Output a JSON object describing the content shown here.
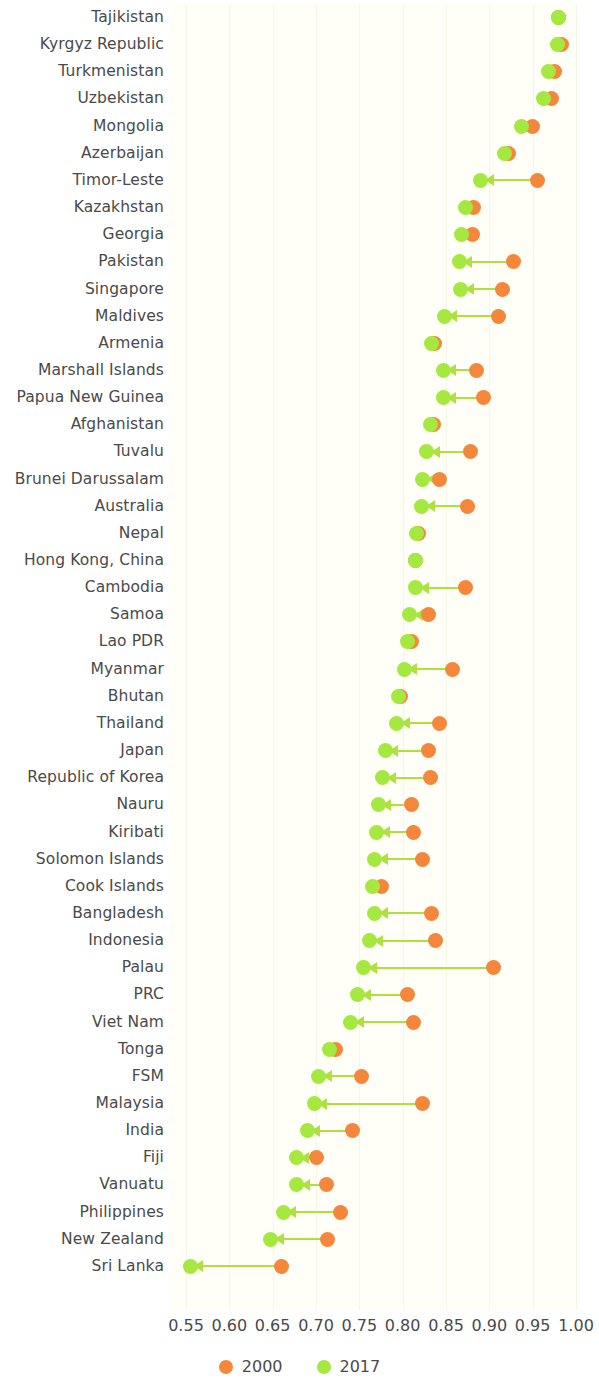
{
  "chart_data": {
    "type": "scatter",
    "title": "",
    "subtitle": "",
    "xlabel": "",
    "ylabel": "",
    "xlim": [
      0.55,
      1.0
    ],
    "xticks": [
      0.55,
      0.6,
      0.65,
      0.7,
      0.75,
      0.8,
      0.85,
      0.9,
      0.95,
      1.0
    ],
    "xtick_labels": [
      "0.55",
      "0.60",
      "0.65",
      "0.70",
      "0.75",
      "0.80",
      "0.85",
      "0.90",
      "0.95",
      "1.00"
    ],
    "grid": true,
    "legend_position": "bottom",
    "orientation": "horizontal",
    "series": [
      {
        "name": "2000",
        "color": "#f5873c"
      },
      {
        "name": "2017",
        "color": "#a5e83f"
      }
    ],
    "categories": [
      "Tajikistan",
      "Kyrgyz Republic",
      "Turkmenistan",
      "Uzbekistan",
      "Mongolia",
      "Azerbaijan",
      "Timor-Leste",
      "Kazakhstan",
      "Georgia",
      "Pakistan",
      "Singapore",
      "Maldives",
      "Armenia",
      "Marshall Islands",
      "Papua New Guinea",
      "Afghanistan",
      "Tuvalu",
      "Brunei Darussalam",
      "Australia",
      "Nepal",
      "Hong Kong, China",
      "Cambodia",
      "Samoa",
      "Lao PDR",
      "Myanmar",
      "Bhutan",
      "Thailand",
      "Japan",
      "Republic of Korea",
      "Nauru",
      "Kiribati",
      "Solomon Islands",
      "Cook Islands",
      "Bangladesh",
      "Indonesia",
      "Palau",
      "PRC",
      "Viet Nam",
      "Tonga",
      "FSM",
      "Malaysia",
      "India",
      "Fiji",
      "Vanuatu",
      "Philippines",
      "New Zealand",
      "Sri Lanka"
    ],
    "points": [
      {
        "category": "Tajikistan",
        "v2000": 0.98,
        "v2017": 0.98
      },
      {
        "category": "Kyrgyz Republic",
        "v2000": 0.983,
        "v2017": 0.979
      },
      {
        "category": "Turkmenistan",
        "v2000": 0.975,
        "v2017": 0.968
      },
      {
        "category": "Uzbekistan",
        "v2000": 0.972,
        "v2017": 0.963
      },
      {
        "category": "Mongolia",
        "v2000": 0.95,
        "v2017": 0.937
      },
      {
        "category": "Azerbaijan",
        "v2000": 0.922,
        "v2017": 0.918
      },
      {
        "category": "Timor-Leste",
        "v2000": 0.955,
        "v2017": 0.89
      },
      {
        "category": "Kazakhstan",
        "v2000": 0.882,
        "v2017": 0.872
      },
      {
        "category": "Georgia",
        "v2000": 0.88,
        "v2017": 0.868
      },
      {
        "category": "Pakistan",
        "v2000": 0.928,
        "v2017": 0.865
      },
      {
        "category": "Singapore",
        "v2000": 0.915,
        "v2017": 0.867
      },
      {
        "category": "Maldives",
        "v2000": 0.91,
        "v2017": 0.848
      },
      {
        "category": "Armenia",
        "v2000": 0.837,
        "v2017": 0.833
      },
      {
        "category": "Marshall Islands",
        "v2000": 0.885,
        "v2017": 0.847
      },
      {
        "category": "Papua New Guinea",
        "v2000": 0.893,
        "v2017": 0.847
      },
      {
        "category": "Afghanistan",
        "v2000": 0.836,
        "v2017": 0.832
      },
      {
        "category": "Tuvalu",
        "v2000": 0.878,
        "v2017": 0.828
      },
      {
        "category": "Brunei Darussalam",
        "v2000": 0.842,
        "v2017": 0.823
      },
      {
        "category": "Australia",
        "v2000": 0.875,
        "v2017": 0.822
      },
      {
        "category": "Nepal",
        "v2000": 0.818,
        "v2017": 0.816
      },
      {
        "category": "Hong Kong, China",
        "v2000": 0.815,
        "v2017": 0.815
      },
      {
        "category": "Cambodia",
        "v2000": 0.872,
        "v2017": 0.815
      },
      {
        "category": "Samoa",
        "v2000": 0.83,
        "v2017": 0.808
      },
      {
        "category": "Lao PDR",
        "v2000": 0.81,
        "v2017": 0.805
      },
      {
        "category": "Myanmar",
        "v2000": 0.858,
        "v2017": 0.802
      },
      {
        "category": "Bhutan",
        "v2000": 0.797,
        "v2017": 0.795
      },
      {
        "category": "Thailand",
        "v2000": 0.843,
        "v2017": 0.793
      },
      {
        "category": "Japan",
        "v2000": 0.83,
        "v2017": 0.78
      },
      {
        "category": "Republic of Korea",
        "v2000": 0.832,
        "v2017": 0.777
      },
      {
        "category": "Nauru",
        "v2000": 0.81,
        "v2017": 0.772
      },
      {
        "category": "Kiribati",
        "v2000": 0.812,
        "v2017": 0.77
      },
      {
        "category": "Solomon Islands",
        "v2000": 0.823,
        "v2017": 0.768
      },
      {
        "category": "Cook Islands",
        "v2000": 0.775,
        "v2017": 0.765
      },
      {
        "category": "Bangladesh",
        "v2000": 0.833,
        "v2017": 0.768
      },
      {
        "category": "Indonesia",
        "v2000": 0.838,
        "v2017": 0.762
      },
      {
        "category": "Palau",
        "v2000": 0.905,
        "v2017": 0.755
      },
      {
        "category": "PRC",
        "v2000": 0.805,
        "v2017": 0.748
      },
      {
        "category": "Viet Nam",
        "v2000": 0.812,
        "v2017": 0.74
      },
      {
        "category": "Tonga",
        "v2000": 0.723,
        "v2017": 0.715
      },
      {
        "category": "FSM",
        "v2000": 0.753,
        "v2017": 0.703
      },
      {
        "category": "Malaysia",
        "v2000": 0.823,
        "v2017": 0.698
      },
      {
        "category": "India",
        "v2000": 0.742,
        "v2017": 0.69
      },
      {
        "category": "Fiji",
        "v2000": 0.7,
        "v2017": 0.677
      },
      {
        "category": "Vanuatu",
        "v2000": 0.712,
        "v2017": 0.678
      },
      {
        "category": "Philippines",
        "v2000": 0.728,
        "v2017": 0.662
      },
      {
        "category": "New Zealand",
        "v2000": 0.713,
        "v2017": 0.648
      },
      {
        "category": "Sri Lanka",
        "v2000": 0.66,
        "v2017": 0.555
      }
    ]
  },
  "legend": {
    "items": [
      {
        "label": "2000",
        "color": "#f5873c"
      },
      {
        "label": "2017",
        "color": "#a5e83f"
      }
    ]
  },
  "colors": {
    "series_2000": "#f5873c",
    "series_2017": "#a5e83f",
    "connector": "#aee03f",
    "text": "#4a4a4a",
    "plot_background": "#fffff8",
    "gridline": "#f6f6e8"
  }
}
